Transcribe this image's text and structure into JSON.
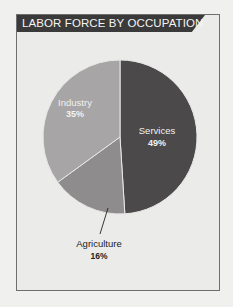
{
  "header": {
    "title": "LABOR FORCE BY OCCUPATION"
  },
  "colors": {
    "services": "#4b4949",
    "agriculture": "#8e8c8c",
    "industry": "#a7a5a5",
    "header_bg": "#3a3a3a",
    "panel_bg": "#ebebea",
    "border": "#6e6e6e"
  },
  "labels": {
    "services_name": "Services",
    "services_pct": "49%",
    "industry_name": "Industry",
    "industry_pct": "35%",
    "agriculture_name": "Agriculture",
    "agriculture_pct": "16%"
  },
  "chart_data": {
    "type": "pie",
    "title": "LABOR FORCE BY OCCUPATION",
    "categories": [
      "Services",
      "Agriculture",
      "Industry"
    ],
    "values": [
      49,
      16,
      35
    ],
    "unit": "%",
    "start_angle": "12 o'clock, clockwise",
    "legend": "none (direct labels)",
    "annotations": [
      "Agriculture label connected by leader line below chart"
    ]
  }
}
